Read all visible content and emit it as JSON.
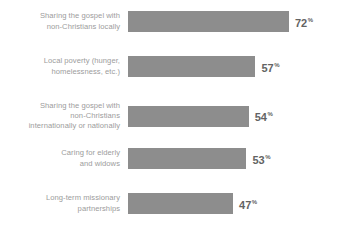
{
  "chart_data": {
    "type": "bar",
    "orientation": "horizontal",
    "title": "",
    "subtitle": "",
    "xlabel": "",
    "ylabel": "",
    "xlim": [
      0,
      100
    ],
    "grid": false,
    "legend": null,
    "value_suffix": "%",
    "categories": [
      "Sharing the gospel with\nnon-Christians locally",
      "Local poverty (hunger,\nhomelessness, etc.)",
      "Sharing the gospel with\nnon-Christians\ninternationally or nationally",
      "Caring for elderly\nand widows",
      "Long-term missionary\npartnerships"
    ],
    "values": [
      72,
      57,
      54,
      53,
      47
    ],
    "value_labels": [
      "72",
      "57",
      "54",
      "53",
      "47"
    ],
    "colors": {
      "bar": "#8d8d8d",
      "label_text": "#9c9c9c",
      "value_text": "#636363",
      "background": "#ffffff"
    }
  },
  "rows": [
    {
      "label": "Sharing the gospel with\nnon-Christians locally",
      "value": "72",
      "pct": "%"
    },
    {
      "label": "Local poverty (hunger,\nhomelessness, etc.)",
      "value": "57",
      "pct": "%"
    },
    {
      "label": "Sharing the gospel with\nnon-Christians\ninternationally or nationally",
      "value": "54",
      "pct": "%"
    },
    {
      "label": "Caring for elderly\nand widows",
      "value": "53",
      "pct": "%"
    },
    {
      "label": "Long-term missionary\npartnerships",
      "value": "47",
      "pct": "%"
    }
  ]
}
